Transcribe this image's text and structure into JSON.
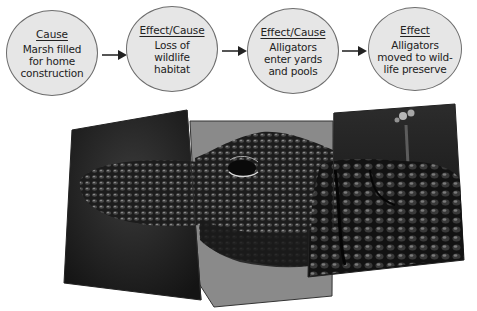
{
  "diagram": {
    "type": "cause-effect-chain",
    "nodes": [
      {
        "heading": "Cause",
        "text": "Marsh filled\nfor home\nconstruction"
      },
      {
        "heading": "Effect/Cause",
        "text": "Loss of\nwildlife\nhabitat"
      },
      {
        "heading": "Effect/Cause",
        "text": "Alligators\nenter yards\nand pools"
      },
      {
        "heading": "Effect",
        "text": "Alligators\nmoved to wild-\nlife preserve"
      }
    ],
    "connectors": [
      "arrow",
      "arrow",
      "arrow"
    ],
    "colors": {
      "node_fill": "#e6e6e6",
      "node_border": "#6d6d6d",
      "text": "#222222",
      "panel_gray": "#8a8a8a"
    }
  },
  "photo": {
    "subject": "alligator-head-collage",
    "panels": [
      "left-snout-panel",
      "center-eye-panel",
      "right-jaw-panel"
    ]
  }
}
